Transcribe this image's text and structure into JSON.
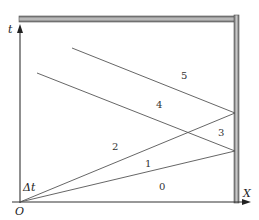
{
  "diagram": {
    "axes": {
      "vertical_label": "t",
      "horizontal_label": "X",
      "origin_label": "O",
      "delta_label": "Δt"
    },
    "region_labels": [
      "0",
      "1",
      "2",
      "3",
      "4",
      "5"
    ],
    "colors": {
      "line": "#555555",
      "axis": "#333333",
      "bar_dark": "#6e6e6e",
      "bar_light": "#c8c8c8"
    }
  }
}
